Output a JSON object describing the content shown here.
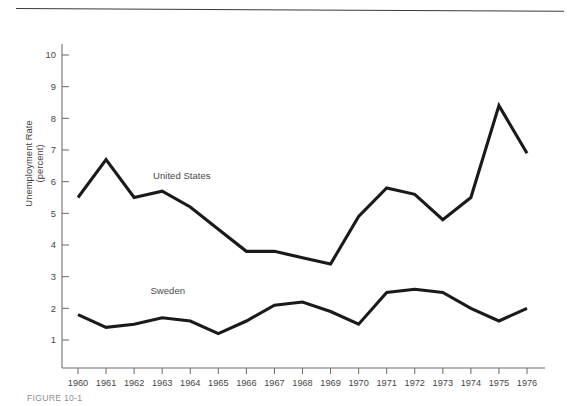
{
  "figure": {
    "caption": "FIGURE 10-1"
  },
  "chart_data": {
    "type": "line",
    "title": "",
    "xlabel": "",
    "ylabel": "Unemployment Rate (percent)",
    "ylabel_line1": "Unemployment Rate",
    "ylabel_line2": "(percent)",
    "grid": false,
    "legend_position": "inline-annotations",
    "xlim": [
      1960,
      1976
    ],
    "ylim": [
      0,
      10.6
    ],
    "yticks": [
      1,
      2,
      3,
      4,
      5,
      6,
      7,
      8,
      9,
      10
    ],
    "ytick_labels": [
      "1",
      "2",
      "3",
      "4",
      "5",
      "6",
      "7",
      "8",
      "9",
      "10"
    ],
    "x": [
      1960,
      1961,
      1962,
      1963,
      1964,
      1965,
      1966,
      1967,
      1968,
      1969,
      1970,
      1971,
      1972,
      1973,
      1974,
      1975,
      1976
    ],
    "xtick_labels": [
      "1960",
      "1961",
      "1962",
      "1963",
      "1964",
      "1965",
      "1966",
      "1967",
      "1968",
      "1969",
      "1970",
      "1971",
      "1972",
      "1973",
      "1974",
      "1975",
      "1976"
    ],
    "series": [
      {
        "name": "United States",
        "color": "#1a1a1a",
        "values": [
          5.5,
          6.7,
          5.5,
          5.7,
          5.2,
          4.5,
          3.8,
          3.8,
          3.6,
          3.4,
          4.9,
          5.8,
          5.6,
          4.8,
          5.5,
          8.4,
          6.9
        ]
      },
      {
        "name": "Sweden",
        "color": "#1a1a1a",
        "values": [
          1.8,
          1.4,
          1.5,
          1.7,
          1.6,
          1.2,
          1.6,
          2.1,
          2.2,
          1.9,
          1.5,
          2.5,
          2.6,
          2.5,
          2.0,
          1.6,
          2.0
        ]
      }
    ],
    "annotations": [
      {
        "text": "United States",
        "x": 1963.7,
        "y": 6.1
      },
      {
        "text": "Sweden",
        "x": 1963.2,
        "y": 2.45
      }
    ]
  }
}
